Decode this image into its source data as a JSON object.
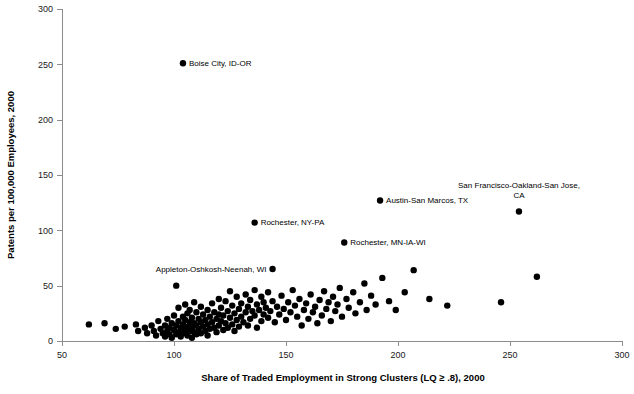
{
  "chart_data": {
    "type": "scatter",
    "title": "",
    "xlabel": "Share of Traded Employment in Strong Clusters (LQ ≥ .8), 2000",
    "ylabel": "Patents per 100,000 Employees, 2000",
    "xlim": [
      50,
      300
    ],
    "ylim": [
      0,
      300
    ],
    "xticks": [
      50,
      100,
      150,
      200,
      250,
      300
    ],
    "yticks": [
      0,
      50,
      100,
      150,
      200,
      250,
      300
    ],
    "grid": false,
    "legend": null,
    "marker": {
      "shape": "circle",
      "color": "#000000",
      "size": 3.2
    },
    "annotations": [
      {
        "label": "Boise City, ID-OR",
        "x": 104,
        "y": 251,
        "anchor": "left",
        "dx": 6,
        "dy": 2.5,
        "lines": [
          "Boise City, ID-OR"
        ]
      },
      {
        "label": "Rochester, NY-PA",
        "x": 136,
        "y": 107,
        "anchor": "left",
        "dx": 6,
        "dy": 2.5,
        "lines": [
          "Rochester, NY-PA"
        ]
      },
      {
        "label": "Rochester, MN-IA-WI",
        "x": 176,
        "y": 89,
        "anchor": "left",
        "dx": 6,
        "dy": 2.5,
        "lines": [
          "Rochester, MN-IA-WI"
        ]
      },
      {
        "label": "Appleton-Oshkosh-Neenah, WI",
        "x": 144,
        "y": 65,
        "anchor": "right",
        "dx": -6,
        "dy": 2.5,
        "lines": [
          "Appleton-Oshkosh-Neenah, WI"
        ]
      },
      {
        "label": "Austin-San Marcos, TX",
        "x": 192,
        "y": 127,
        "anchor": "left",
        "dx": 6,
        "dy": 2.5,
        "lines": [
          "Austin-San Marcos, TX"
        ]
      },
      {
        "label": "San Francisco-Oakland-San Jose, CA",
        "x": 254,
        "y": 117,
        "anchor": "above-center",
        "dx": 0,
        "dy": -14,
        "lines": [
          "San Francisco-Oakland-San Jose,",
          "CA"
        ]
      }
    ],
    "points": [
      {
        "x": 104,
        "y": 251,
        "label": "Boise City, ID-OR"
      },
      {
        "x": 136,
        "y": 107,
        "label": "Rochester, NY-PA"
      },
      {
        "x": 176,
        "y": 89,
        "label": "Rochester, MN-IA-WI"
      },
      {
        "x": 144,
        "y": 65,
        "label": "Appleton-Oshkosh-Neenah, WI"
      },
      {
        "x": 192,
        "y": 127,
        "label": "Austin-San Marcos, TX"
      },
      {
        "x": 254,
        "y": 117,
        "label": "San Francisco-Oakland-San Jose, CA"
      },
      {
        "x": 62,
        "y": 15
      },
      {
        "x": 69,
        "y": 16
      },
      {
        "x": 74,
        "y": 11
      },
      {
        "x": 78,
        "y": 13
      },
      {
        "x": 83,
        "y": 15
      },
      {
        "x": 84,
        "y": 9
      },
      {
        "x": 87,
        "y": 12
      },
      {
        "x": 88,
        "y": 7
      },
      {
        "x": 90,
        "y": 14
      },
      {
        "x": 91,
        "y": 9
      },
      {
        "x": 92,
        "y": 5
      },
      {
        "x": 93,
        "y": 18
      },
      {
        "x": 94,
        "y": 11
      },
      {
        "x": 95,
        "y": 7
      },
      {
        "x": 96,
        "y": 14
      },
      {
        "x": 96,
        "y": 4
      },
      {
        "x": 97,
        "y": 20
      },
      {
        "x": 97,
        "y": 9
      },
      {
        "x": 98,
        "y": 12
      },
      {
        "x": 98,
        "y": 6
      },
      {
        "x": 99,
        "y": 16
      },
      {
        "x": 99,
        "y": 3
      },
      {
        "x": 100,
        "y": 23
      },
      {
        "x": 100,
        "y": 10
      },
      {
        "x": 101,
        "y": 50
      },
      {
        "x": 101,
        "y": 14
      },
      {
        "x": 101,
        "y": 6
      },
      {
        "x": 102,
        "y": 30
      },
      {
        "x": 102,
        "y": 18
      },
      {
        "x": 102,
        "y": 8
      },
      {
        "x": 103,
        "y": 12
      },
      {
        "x": 103,
        "y": 4
      },
      {
        "x": 104,
        "y": 22
      },
      {
        "x": 104,
        "y": 15
      },
      {
        "x": 104,
        "y": 7
      },
      {
        "x": 105,
        "y": 33
      },
      {
        "x": 105,
        "y": 19
      },
      {
        "x": 105,
        "y": 10
      },
      {
        "x": 106,
        "y": 25
      },
      {
        "x": 106,
        "y": 13
      },
      {
        "x": 106,
        "y": 5
      },
      {
        "x": 107,
        "y": 28
      },
      {
        "x": 107,
        "y": 17
      },
      {
        "x": 107,
        "y": 9
      },
      {
        "x": 108,
        "y": 21
      },
      {
        "x": 108,
        "y": 12
      },
      {
        "x": 108,
        "y": 3
      },
      {
        "x": 109,
        "y": 35
      },
      {
        "x": 109,
        "y": 16
      },
      {
        "x": 109,
        "y": 8
      },
      {
        "x": 110,
        "y": 26
      },
      {
        "x": 110,
        "y": 14
      },
      {
        "x": 110,
        "y": 6
      },
      {
        "x": 111,
        "y": 20
      },
      {
        "x": 111,
        "y": 11
      },
      {
        "x": 112,
        "y": 31
      },
      {
        "x": 112,
        "y": 17
      },
      {
        "x": 112,
        "y": 7
      },
      {
        "x": 113,
        "y": 24
      },
      {
        "x": 113,
        "y": 13
      },
      {
        "x": 114,
        "y": 19
      },
      {
        "x": 114,
        "y": 9
      },
      {
        "x": 115,
        "y": 28
      },
      {
        "x": 115,
        "y": 15
      },
      {
        "x": 115,
        "y": 5
      },
      {
        "x": 116,
        "y": 22
      },
      {
        "x": 116,
        "y": 11
      },
      {
        "x": 117,
        "y": 34
      },
      {
        "x": 117,
        "y": 17
      },
      {
        "x": 118,
        "y": 26
      },
      {
        "x": 118,
        "y": 12
      },
      {
        "x": 119,
        "y": 20
      },
      {
        "x": 119,
        "y": 8
      },
      {
        "x": 120,
        "y": 38
      },
      {
        "x": 120,
        "y": 24
      },
      {
        "x": 120,
        "y": 14
      },
      {
        "x": 121,
        "y": 30
      },
      {
        "x": 121,
        "y": 18
      },
      {
        "x": 122,
        "y": 23
      },
      {
        "x": 122,
        "y": 10
      },
      {
        "x": 123,
        "y": 36
      },
      {
        "x": 123,
        "y": 16
      },
      {
        "x": 124,
        "y": 27
      },
      {
        "x": 124,
        "y": 12
      },
      {
        "x": 125,
        "y": 45
      },
      {
        "x": 125,
        "y": 21
      },
      {
        "x": 126,
        "y": 32
      },
      {
        "x": 126,
        "y": 15
      },
      {
        "x": 127,
        "y": 25
      },
      {
        "x": 127,
        "y": 9
      },
      {
        "x": 128,
        "y": 40
      },
      {
        "x": 128,
        "y": 19
      },
      {
        "x": 129,
        "y": 29
      },
      {
        "x": 129,
        "y": 13
      },
      {
        "x": 130,
        "y": 34
      },
      {
        "x": 130,
        "y": 22
      },
      {
        "x": 131,
        "y": 17
      },
      {
        "x": 132,
        "y": 42
      },
      {
        "x": 132,
        "y": 26
      },
      {
        "x": 133,
        "y": 31
      },
      {
        "x": 133,
        "y": 14
      },
      {
        "x": 134,
        "y": 37
      },
      {
        "x": 134,
        "y": 20
      },
      {
        "x": 135,
        "y": 27
      },
      {
        "x": 136,
        "y": 46
      },
      {
        "x": 136,
        "y": 23
      },
      {
        "x": 137,
        "y": 33
      },
      {
        "x": 137,
        "y": 12
      },
      {
        "x": 138,
        "y": 28
      },
      {
        "x": 139,
        "y": 40
      },
      {
        "x": 139,
        "y": 18
      },
      {
        "x": 140,
        "y": 35
      },
      {
        "x": 140,
        "y": 24
      },
      {
        "x": 141,
        "y": 30
      },
      {
        "x": 142,
        "y": 44
      },
      {
        "x": 142,
        "y": 21
      },
      {
        "x": 143,
        "y": 27
      },
      {
        "x": 144,
        "y": 36
      },
      {
        "x": 145,
        "y": 17
      },
      {
        "x": 146,
        "y": 31
      },
      {
        "x": 147,
        "y": 24
      },
      {
        "x": 148,
        "y": 41
      },
      {
        "x": 149,
        "y": 29
      },
      {
        "x": 150,
        "y": 19
      },
      {
        "x": 151,
        "y": 35
      },
      {
        "x": 152,
        "y": 26
      },
      {
        "x": 153,
        "y": 46
      },
      {
        "x": 154,
        "y": 32
      },
      {
        "x": 155,
        "y": 22
      },
      {
        "x": 156,
        "y": 38
      },
      {
        "x": 157,
        "y": 14
      },
      {
        "x": 158,
        "y": 28
      },
      {
        "x": 159,
        "y": 34
      },
      {
        "x": 160,
        "y": 20
      },
      {
        "x": 161,
        "y": 42
      },
      {
        "x": 162,
        "y": 26
      },
      {
        "x": 163,
        "y": 31
      },
      {
        "x": 164,
        "y": 16
      },
      {
        "x": 165,
        "y": 37
      },
      {
        "x": 166,
        "y": 23
      },
      {
        "x": 167,
        "y": 45
      },
      {
        "x": 168,
        "y": 29
      },
      {
        "x": 169,
        "y": 35
      },
      {
        "x": 170,
        "y": 18
      },
      {
        "x": 171,
        "y": 40
      },
      {
        "x": 172,
        "y": 27
      },
      {
        "x": 173,
        "y": 33
      },
      {
        "x": 174,
        "y": 48
      },
      {
        "x": 175,
        "y": 22
      },
      {
        "x": 177,
        "y": 38
      },
      {
        "x": 178,
        "y": 30
      },
      {
        "x": 180,
        "y": 44
      },
      {
        "x": 181,
        "y": 25
      },
      {
        "x": 183,
        "y": 35
      },
      {
        "x": 185,
        "y": 52
      },
      {
        "x": 186,
        "y": 28
      },
      {
        "x": 188,
        "y": 41
      },
      {
        "x": 190,
        "y": 33
      },
      {
        "x": 193,
        "y": 57
      },
      {
        "x": 196,
        "y": 36
      },
      {
        "x": 199,
        "y": 28
      },
      {
        "x": 203,
        "y": 44
      },
      {
        "x": 207,
        "y": 64
      },
      {
        "x": 214,
        "y": 38
      },
      {
        "x": 222,
        "y": 32
      },
      {
        "x": 246,
        "y": 35
      },
      {
        "x": 262,
        "y": 58
      }
    ]
  }
}
